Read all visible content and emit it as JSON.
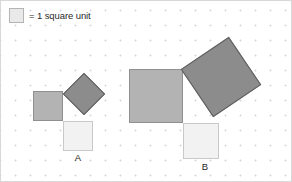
{
  "panel": {
    "width": 292,
    "height": 182,
    "background_color": "#ffffff",
    "border_color": "#d8d8d8",
    "grid": {
      "type": "dots",
      "spacing_px": 15,
      "dot_color": "#d6d6e2"
    }
  },
  "legend": {
    "swatch_icon": "unit-square-swatch",
    "swatch_fill_color": "#e9e9e9",
    "swatch_border_color": "#b4b4b4",
    "text": "= 1 square unit"
  },
  "figures": [
    {
      "id": "A",
      "label": "A",
      "description": "right triangle with a square built on each side",
      "squares": [
        {
          "role": "vertical-leg",
          "name": "square-a-leg",
          "fill_color": "#b3b3b3",
          "border_color": "#8f8f8f",
          "side_px": 30,
          "side_units": 2,
          "area_units": 4,
          "rotation_deg": 0
        },
        {
          "role": "horizontal-leg",
          "name": "square-a-base",
          "fill_color": "#f2f2f2",
          "border_color": "#c9c9c9",
          "side_px": 30,
          "side_units": 2,
          "area_units": 4,
          "rotation_deg": 0
        },
        {
          "role": "hypotenuse",
          "name": "square-a-hypotenuse",
          "fill_color": "#8c8c8c",
          "border_color": "#5e5e5e",
          "side_px": 30,
          "area_units": 8,
          "rotation_deg": 45
        }
      ]
    },
    {
      "id": "B",
      "label": "B",
      "description": "right triangle with a square built on each side",
      "squares": [
        {
          "role": "vertical-leg",
          "name": "square-b-leg",
          "fill_color": "#b3b3b3",
          "border_color": "#8f8f8f",
          "side_px": 54,
          "side_units": 3.6,
          "area_units": 13,
          "rotation_deg": 0
        },
        {
          "role": "horizontal-leg",
          "name": "square-b-base",
          "fill_color": "#f2f2f2",
          "border_color": "#c9c9c9",
          "side_px": 36,
          "side_units": 2.4,
          "area_units": 6,
          "rotation_deg": 0
        },
        {
          "role": "hypotenuse",
          "name": "square-b-hypotenuse",
          "fill_color": "#8c8c8c",
          "border_color": "#5e5e5e",
          "side_px": 58,
          "area_units": 19,
          "rotation_deg": -34
        }
      ]
    }
  ]
}
